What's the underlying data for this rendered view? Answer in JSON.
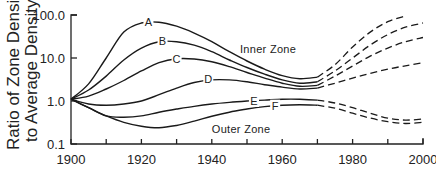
{
  "chart_data": {
    "type": "line",
    "title": "",
    "xlabel": "",
    "ylabel": "Ratio of Zone Density to Average Density",
    "ylabel_lines": [
      "Ratio of Zone Density",
      "to Average Density"
    ],
    "yscale": "log",
    "xlim": [
      1900,
      2000
    ],
    "ylim": [
      0.1,
      100
    ],
    "x_ticks": [
      1900,
      1910,
      1920,
      1930,
      1940,
      1950,
      1960,
      1970,
      1980,
      1990,
      2000
    ],
    "x_tick_labels": [
      "1900",
      "1920",
      "1940",
      "1960",
      "1980",
      "2000"
    ],
    "y_ticks": [
      0.1,
      1,
      10,
      100
    ],
    "y_tick_labels": [
      "0.1",
      "1.0",
      "10.0",
      "100.0"
    ],
    "grid": false,
    "annotations": [
      {
        "text": "Inner Zone",
        "x": 1948,
        "y": 16
      },
      {
        "text": "Outer Zone",
        "x": 1940,
        "y": 0.22
      }
    ],
    "series": [
      {
        "name": "A",
        "label_at": [
          1922,
          68
        ],
        "x": [
          1900,
          1905,
          1910,
          1915,
          1920,
          1925,
          1930,
          1935,
          1940,
          1945,
          1950,
          1955,
          1960,
          1965,
          1970
        ],
        "y": [
          1.1,
          2.5,
          10,
          40,
          65,
          68,
          55,
          38,
          24,
          14,
          8.5,
          5.5,
          3.9,
          3.3,
          3.6
        ],
        "projection": {
          "x": [
            1970,
            1975,
            1980,
            1985,
            1990,
            1995
          ],
          "y": [
            3.6,
            7,
            18,
            40,
            70,
            95
          ]
        }
      },
      {
        "name": "B",
        "label_at": [
          1926,
          25
        ],
        "x": [
          1900,
          1905,
          1910,
          1915,
          1920,
          1925,
          1930,
          1935,
          1940,
          1945,
          1950,
          1955,
          1960,
          1965,
          1970
        ],
        "y": [
          1.1,
          1.8,
          3.8,
          9,
          17,
          24,
          24,
          20,
          14,
          9,
          6,
          4.2,
          3.1,
          2.6,
          2.8
        ],
        "projection": {
          "x": [
            1970,
            1975,
            1980,
            1985,
            1990,
            1995,
            2000
          ],
          "y": [
            2.8,
            5,
            10,
            20,
            35,
            52,
            65
          ]
        }
      },
      {
        "name": "C",
        "label_at": [
          1930,
          9.5
        ],
        "x": [
          1900,
          1905,
          1910,
          1915,
          1920,
          1925,
          1930,
          1935,
          1940,
          1945,
          1950,
          1955,
          1960,
          1965,
          1970
        ],
        "y": [
          1.1,
          1.3,
          1.9,
          3.0,
          5.0,
          7.8,
          9.6,
          9.5,
          8.2,
          6.3,
          4.6,
          3.4,
          2.6,
          2.2,
          2.3
        ],
        "projection": {
          "x": [
            1970,
            1975,
            1980,
            1985,
            1990,
            1995,
            2000
          ],
          "y": [
            2.3,
            3.8,
            6.5,
            11,
            17,
            24,
            30
          ]
        }
      },
      {
        "name": "D",
        "label_at": [
          1939,
          3.2
        ],
        "x": [
          1900,
          1905,
          1910,
          1915,
          1920,
          1925,
          1930,
          1935,
          1940,
          1945,
          1950,
          1955,
          1960,
          1965,
          1970
        ],
        "y": [
          1.1,
          0.85,
          0.8,
          0.85,
          1.0,
          1.4,
          2.0,
          2.7,
          3.1,
          3.1,
          2.8,
          2.4,
          2.1,
          1.9,
          2.0
        ],
        "projection": {
          "x": [
            1970,
            1975,
            1980,
            1985,
            1990,
            1995,
            2000
          ],
          "y": [
            2.0,
            2.6,
            3.4,
            4.4,
            5.5,
            6.6,
            7.8
          ]
        }
      },
      {
        "name": "E",
        "label_at": [
          1952,
          1.0
        ],
        "x": [
          1900,
          1905,
          1910,
          1915,
          1920,
          1925,
          1930,
          1935,
          1940,
          1945,
          1950,
          1955,
          1960,
          1965,
          1970
        ],
        "y": [
          1.1,
          0.7,
          0.45,
          0.42,
          0.45,
          0.55,
          0.65,
          0.75,
          0.85,
          0.93,
          1.0,
          1.05,
          1.1,
          1.1,
          1.05
        ],
        "projection": {
          "x": [
            1970,
            1975,
            1980,
            1985,
            1990,
            1995,
            2000
          ],
          "y": [
            1.05,
            0.9,
            0.7,
            0.52,
            0.4,
            0.36,
            0.38
          ]
        }
      },
      {
        "name": "F",
        "label_at": [
          1958,
          0.78
        ],
        "x": [
          1900,
          1905,
          1910,
          1915,
          1920,
          1925,
          1930,
          1935,
          1940,
          1945,
          1950,
          1955,
          1960,
          1965,
          1970
        ],
        "y": [
          1.1,
          0.7,
          0.45,
          0.32,
          0.26,
          0.24,
          0.27,
          0.34,
          0.44,
          0.55,
          0.65,
          0.74,
          0.8,
          0.82,
          0.8
        ],
        "projection": {
          "x": [
            1970,
            1975,
            1980,
            1985,
            1990,
            1995,
            2000
          ],
          "y": [
            0.8,
            0.68,
            0.52,
            0.4,
            0.33,
            0.3,
            0.32
          ]
        }
      }
    ]
  },
  "layout": {
    "plot_left": 71,
    "plot_right": 423,
    "plot_top": 15,
    "plot_bottom": 144
  }
}
